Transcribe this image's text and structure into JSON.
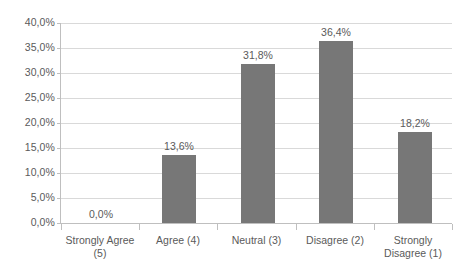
{
  "chart_data": {
    "type": "bar",
    "title": "",
    "subtitle": "",
    "xlabel": "",
    "ylabel": "",
    "categories": [
      "Strongly Agree (5)",
      "Agree (4)",
      "Neutral (3)",
      "Disagree (2)",
      "Strongly Disagree (1)"
    ],
    "values": [
      0.0,
      13.6,
      31.8,
      36.4,
      18.2
    ],
    "data_labels": [
      "0,0%",
      "13,6%",
      "31,8%",
      "36,4%",
      "18,2%"
    ],
    "ylim": [
      0,
      40
    ],
    "ytick_values": [
      0.0,
      5.0,
      10.0,
      15.0,
      20.0,
      25.0,
      30.0,
      35.0,
      40.0
    ],
    "ytick_labels": [
      "0,0%",
      "5,0%",
      "10,0%",
      "15,0%",
      "20,0%",
      "25,0%",
      "30,0%",
      "35,0%",
      "40,0%"
    ],
    "grid": true,
    "legend": false,
    "legend_position": "none",
    "decimal_separator": ",",
    "unit": "%",
    "colors": {
      "bar": "#777777",
      "gridline": "#d9d9d9",
      "axis": "#bfbfbf",
      "text": "#5a5a5a",
      "background": "#ffffff"
    }
  }
}
